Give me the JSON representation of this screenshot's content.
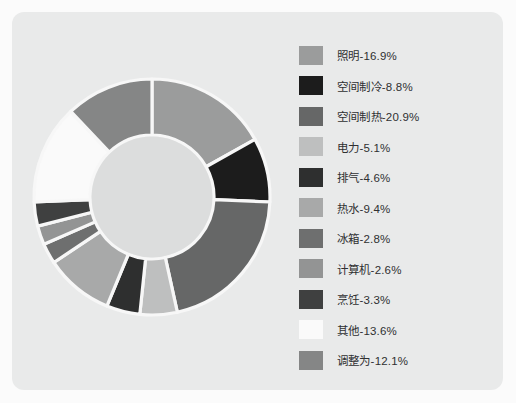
{
  "panel": {
    "background_color": "#e9eaea",
    "page_background_color": "#fbfbfb"
  },
  "chart_data": {
    "type": "pie",
    "variant": "donut",
    "title": "",
    "subtitle": "",
    "xlabel": "",
    "ylabel": "",
    "legend_position": "right",
    "grid": false,
    "start_angle_deg": 0,
    "direction": "clockwise",
    "separator_color": "#f7f7f7",
    "hole_color": "#dcdddd",
    "categories": [
      "照明",
      "空间制冷",
      "空间制热",
      "电力",
      "排气",
      "热水",
      "冰箱",
      "计算机",
      "烹饪",
      "其他",
      "调整为"
    ],
    "values": [
      16.9,
      8.8,
      20.9,
      5.1,
      4.6,
      9.4,
      2.8,
      2.6,
      3.3,
      13.6,
      12.1
    ],
    "unit": "%",
    "colors": [
      "#9b9c9c",
      "#1c1c1c",
      "#666767",
      "#bebfbf",
      "#2e2f2f",
      "#a8a9a9",
      "#6e6f6f",
      "#939494",
      "#3f4040",
      "#fafafa",
      "#858686"
    ]
  },
  "legend": {
    "items": [
      {
        "label": "照明-16.9%",
        "color": "#9b9c9c",
        "name": "lighting"
      },
      {
        "label": "空间制冷-8.8%",
        "color": "#1c1c1c",
        "name": "space-cooling"
      },
      {
        "label": "空间制热-20.9%",
        "color": "#666767",
        "name": "space-heating"
      },
      {
        "label": "电力-5.1%",
        "color": "#bebfbf",
        "name": "electricity"
      },
      {
        "label": "排气-4.6%",
        "color": "#2e2f2f",
        "name": "exhaust"
      },
      {
        "label": "热水-9.4%",
        "color": "#a8a9a9",
        "name": "hot-water"
      },
      {
        "label": "冰箱-2.8%",
        "color": "#6e6f6f",
        "name": "refrigerator"
      },
      {
        "label": "计算机-2.6%",
        "color": "#939494",
        "name": "computer"
      },
      {
        "label": "烹饪-3.3%",
        "color": "#3f4040",
        "name": "cooking"
      },
      {
        "label": "其他-13.6%",
        "color": "#fafafa",
        "name": "other"
      },
      {
        "label": "调整为-12.1%",
        "color": "#858686",
        "name": "adjusted-to"
      }
    ]
  }
}
